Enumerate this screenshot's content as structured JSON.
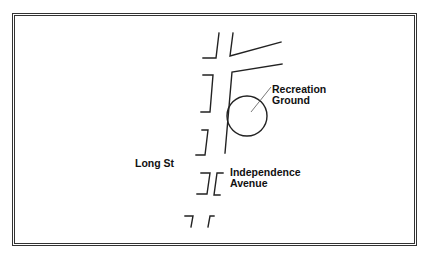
{
  "map": {
    "labels": {
      "recreation_ground": "Recreation\nGround",
      "long_st": "Long St",
      "independence_avenue": "Independence\nAvenue"
    },
    "colors": {
      "line": "#222222",
      "frame": "#333333",
      "background": "#ffffff"
    }
  }
}
